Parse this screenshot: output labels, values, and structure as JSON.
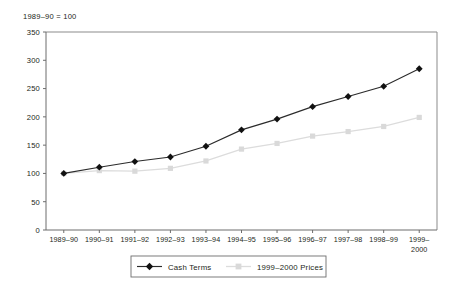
{
  "chart_data": {
    "type": "line",
    "title": "",
    "note": "1989–90 = 100",
    "xlabel": "",
    "ylabel": "",
    "ylim": [
      0,
      350
    ],
    "yticks": [
      0,
      50,
      100,
      150,
      200,
      250,
      300,
      350
    ],
    "ytick_labels": [
      "0",
      "50",
      "100",
      "150",
      "200",
      "250",
      "300",
      "350"
    ],
    "grid": false,
    "legend_position": "bottom",
    "categories": [
      "1989–90",
      "1990–91",
      "1991–92",
      "1992–93",
      "1993–94",
      "1994–95",
      "1995–96",
      "1996–97",
      "1997–98",
      "1998–99",
      "1999–2000"
    ],
    "categories_display": [
      [
        "1989–90"
      ],
      [
        "1990–91"
      ],
      [
        "1991–92"
      ],
      [
        "1992–93"
      ],
      [
        "1993–94"
      ],
      [
        "1994–95"
      ],
      [
        "1995–96"
      ],
      [
        "1996–97"
      ],
      [
        "1997–98"
      ],
      [
        "1998–99"
      ],
      [
        "1999–",
        "2000"
      ]
    ],
    "series": [
      {
        "name": "Cash Terms",
        "color": "#111111",
        "marker": "diamond",
        "values": [
          100,
          111,
          121,
          129,
          148,
          177,
          196,
          218,
          236,
          254,
          285
        ]
      },
      {
        "name": "1999–2000 Prices",
        "color": "#d9d9d9",
        "marker": "square",
        "values": [
          100,
          105,
          104,
          109,
          122,
          143,
          153,
          166,
          174,
          183,
          199
        ]
      }
    ]
  },
  "legend": {
    "items": [
      {
        "label": "Cash Terms"
      },
      {
        "label": "1999–2000 Prices"
      }
    ]
  },
  "colors": {
    "cash_terms": "#111111",
    "prices": "#d9d9d9",
    "axis": "#6d6d6d",
    "frame": "#8b8b8b",
    "text": "#231f20",
    "background": "#ffffff"
  }
}
